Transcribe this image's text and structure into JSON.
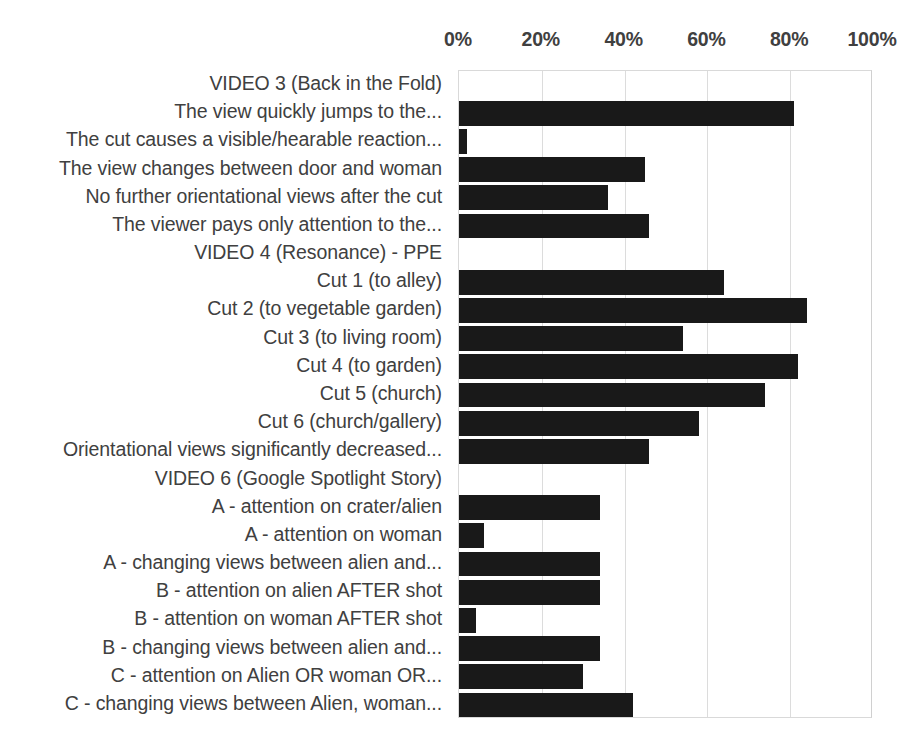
{
  "chart_data": {
    "type": "bar",
    "orientation": "horizontal",
    "title": "",
    "xlabel": "",
    "ylabel": "",
    "xlim": [
      0,
      100
    ],
    "xunit": "%",
    "xticks": [
      0,
      20,
      40,
      60,
      80,
      100
    ],
    "xtick_labels": [
      "0%",
      "20%",
      "40%",
      "60%",
      "80%",
      "100%"
    ],
    "grid": true,
    "legend": "none",
    "bar_color": "#191919",
    "gridline_color": "#dcdcdc",
    "plot_border_color": "#d9d9d9",
    "categories": [
      "VIDEO 3 (Back in the Fold)",
      "The view quickly jumps to the...",
      "The cut causes a visible/hearable reaction...",
      "The view changes between door and woman",
      "No further orientational views after the cut",
      "The viewer pays only attention to the...",
      "VIDEO 4 (Resonance) - PPE",
      "Cut 1 (to alley)",
      "Cut 2 (to vegetable garden)",
      "Cut 3 (to living room)",
      "Cut 4 (to garden)",
      "Cut 5 (church)",
      "Cut 6 (church/gallery)",
      "Orientational views significantly decreased...",
      "VIDEO 6 (Google Spotlight Story)",
      "A - attention on crater/alien",
      "A - attention on woman",
      "A - changing views between alien and...",
      "B - attention on alien AFTER shot",
      "B - attention on woman AFTER shot",
      "B - changing views between alien and...",
      "C - attention on Alien OR woman OR...",
      "C - changing views between Alien, woman..."
    ],
    "values": [
      null,
      81,
      2,
      45,
      36,
      46,
      null,
      64,
      84,
      54,
      82,
      74,
      58,
      46,
      null,
      34,
      6,
      34,
      34,
      4,
      34,
      30,
      42
    ],
    "group_headers": [
      "VIDEO 3 (Back in the Fold)",
      "VIDEO 4 (Resonance) - PPE",
      "VIDEO 6 (Google Spotlight Story)"
    ]
  }
}
